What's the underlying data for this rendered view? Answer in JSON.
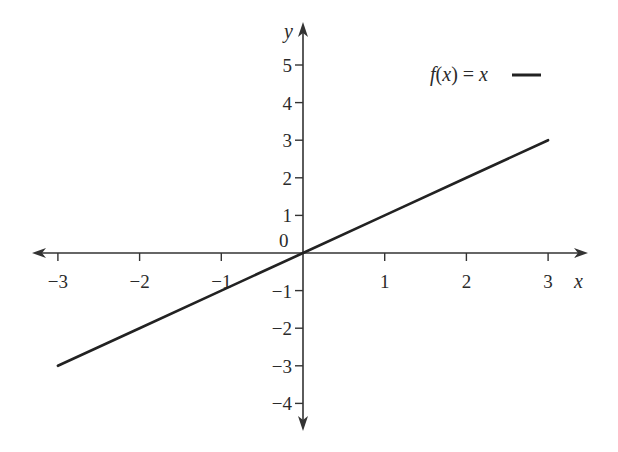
{
  "chart_data": {
    "type": "line",
    "title": "",
    "xlabel": "x",
    "ylabel": "y",
    "xlim": [
      -3,
      3
    ],
    "ylim": [
      -4,
      5
    ],
    "x_ticks": [
      -3,
      -2,
      -1,
      1,
      2,
      3
    ],
    "x_tick_labels": [
      "−3",
      "−2",
      "−1",
      "1",
      "2",
      "3"
    ],
    "y_ticks": [
      -4,
      -3,
      -2,
      -1,
      1,
      2,
      3,
      4,
      5
    ],
    "y_tick_labels": [
      "−4",
      "−3",
      "−2",
      "−1",
      "1",
      "2",
      "3",
      "4",
      "5"
    ],
    "origin_label": "0",
    "grid": false,
    "legend_position": "top-right",
    "series": [
      {
        "name": "f(x) = x",
        "color": "#222222",
        "x": [
          -3,
          -2,
          -1,
          0,
          1,
          2,
          3
        ],
        "y": [
          -3,
          -2,
          -1,
          0,
          1,
          2,
          3
        ]
      }
    ]
  },
  "legend": {
    "f_label": "f",
    "open_paren": "(",
    "var": "x",
    "close_paren": ")",
    "equals": " = ",
    "rhs": "x"
  },
  "colors": {
    "axis": "#333333",
    "line": "#222222",
    "text": "#2a2a2a",
    "background": "#ffffff"
  }
}
